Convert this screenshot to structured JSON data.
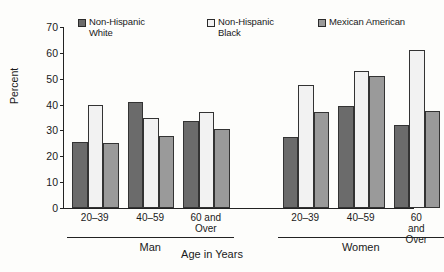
{
  "chart_data": {
    "type": "bar",
    "title": "",
    "xlabel": "Age in Years",
    "ylabel": "Percent",
    "ylim": [
      0,
      70
    ],
    "yticks": [
      0,
      10,
      20,
      30,
      40,
      50,
      60,
      70
    ],
    "grid": false,
    "legend_position": "top",
    "categories": [
      "20–39",
      "40–59",
      "60 and\nOver"
    ],
    "groups": [
      "Man",
      "Women"
    ],
    "series": [
      {
        "name": "Non-Hispanic\nWhite",
        "color": "#6b6b6b",
        "swatch": "s-dark",
        "bar_class": "c-dark",
        "values_by_group": {
          "Man": [
            25.5,
            41.0,
            33.5
          ],
          "Women": [
            27.5,
            39.5,
            32.0
          ]
        }
      },
      {
        "name": "Non-Hispanic\nBlack",
        "color": "#f2f2f2",
        "swatch": "s-light",
        "bar_class": "c-light",
        "values_by_group": {
          "Man": [
            40.0,
            35.0,
            37.0
          ],
          "Women": [
            47.5,
            53.0,
            61.0
          ]
        }
      },
      {
        "name": "Mexican American",
        "color": "#9a9a9a",
        "swatch": "s-mid",
        "bar_class": "c-mid",
        "values_by_group": {
          "Man": [
            25.0,
            28.0,
            30.5
          ],
          "Women": [
            37.0,
            51.0,
            37.5
          ]
        }
      }
    ]
  },
  "legend": {
    "items": [
      {
        "label": "Non-Hispanic\nWhite"
      },
      {
        "label": "Non-Hispanic\nBlack"
      },
      {
        "label": "Mexican American"
      }
    ]
  },
  "axes": {
    "y_title": "Percent",
    "x_title": "Age in Years",
    "y_tick_labels": [
      "0",
      "10",
      "20",
      "30",
      "40",
      "50",
      "60",
      "70"
    ]
  },
  "groups": [
    {
      "label": "Man",
      "categories": [
        "20–39",
        "40–59",
        "60 and\nOver"
      ]
    },
    {
      "label": "Women",
      "categories": [
        "20–39",
        "40–59",
        "60 and\nOver"
      ]
    }
  ]
}
